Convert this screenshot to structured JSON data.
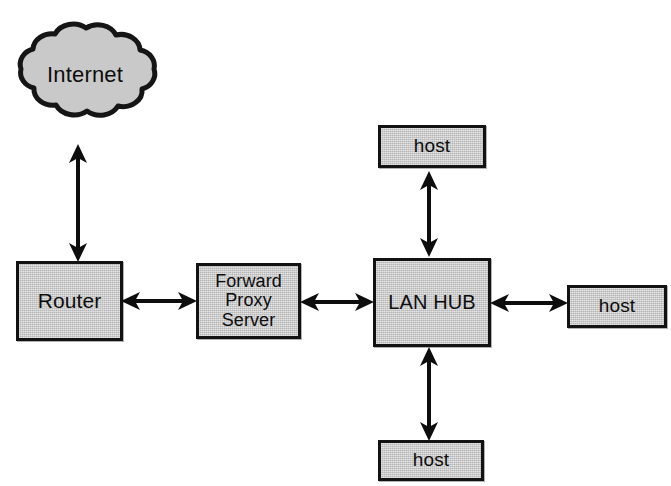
{
  "diagram": {
    "background_color": "#ffffff",
    "node_fill_color": "#c9c9c9",
    "node_border_color": "#121212",
    "connector_color": "#0d0d0d",
    "nodes": {
      "internet": {
        "label": "Internet",
        "shape": "cloud"
      },
      "router": {
        "label": "Router",
        "shape": "rectangle"
      },
      "proxy": {
        "label": "Forward\nProxy\nServer",
        "shape": "rectangle"
      },
      "lan_hub": {
        "label": "LAN HUB",
        "shape": "rectangle"
      },
      "host_top": {
        "label": "host",
        "shape": "rectangle"
      },
      "host_right": {
        "label": "host",
        "shape": "rectangle"
      },
      "host_bottom": {
        "label": "host",
        "shape": "rectangle"
      }
    },
    "connections": [
      {
        "from": "internet",
        "to": "router",
        "style": "double-headed-arrow",
        "orientation": "vertical"
      },
      {
        "from": "router",
        "to": "proxy",
        "style": "double-headed-arrow",
        "orientation": "horizontal"
      },
      {
        "from": "proxy",
        "to": "lan_hub",
        "style": "double-headed-arrow",
        "orientation": "horizontal"
      },
      {
        "from": "lan_hub",
        "to": "host_top",
        "style": "double-headed-arrow",
        "orientation": "vertical"
      },
      {
        "from": "lan_hub",
        "to": "host_right",
        "style": "double-headed-arrow",
        "orientation": "horizontal"
      },
      {
        "from": "lan_hub",
        "to": "host_bottom",
        "style": "double-headed-arrow",
        "orientation": "vertical"
      }
    ]
  }
}
